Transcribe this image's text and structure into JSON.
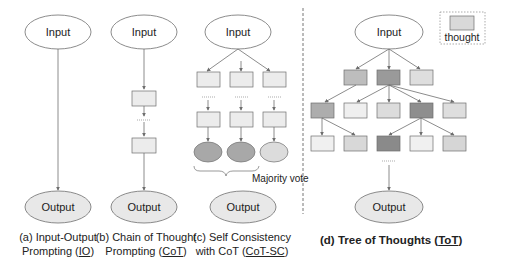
{
  "colors": {
    "input_fill": "#ffffff",
    "output_fill": "#e8e8e8",
    "stroke": "#6e6e6e",
    "thought_light": "#ececec",
    "thought_mid": "#cfcfcf",
    "thought_dark": "#9a9a9a",
    "vote_dark": "#a8a8a8",
    "vote_light": "#dcdcdc",
    "divider": "#777777"
  },
  "labels": {
    "input": "Input",
    "output": "Output",
    "majority_vote": "Majority vote",
    "thought_legend": "thought"
  },
  "panels": [
    {
      "id": "a",
      "caption_line1": "(a) Input-Output",
      "caption_line2_prefix": "Prompting (",
      "caption_abbrev": "IO",
      "caption_suffix": ")"
    },
    {
      "id": "b",
      "caption_line1": "(b) Chain of Thought",
      "caption_line2_prefix": "Prompting (",
      "caption_abbrev": "CoT",
      "caption_suffix": ")"
    },
    {
      "id": "c",
      "caption_line1": "(c) Self Consistency",
      "caption_line2_prefix": "with CoT (",
      "caption_abbrev": "CoT-SC",
      "caption_suffix": ")"
    },
    {
      "id": "d",
      "caption_line1_prefix": "(d) Tree of Thoughts (",
      "caption_abbrev": "ToT",
      "caption_suffix": ")"
    }
  ]
}
